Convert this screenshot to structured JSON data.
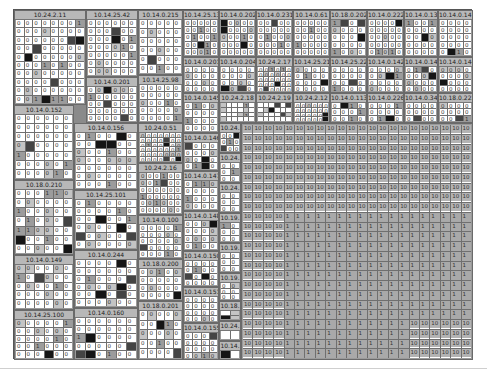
{
  "view": {
    "title": "Host treemap",
    "colors": {
      "background": "#ffffff",
      "frame": "#8a8a8a",
      "header": "#b8b8b8",
      "cell_empty": "#ffffff",
      "cell_light": "#c4c4c4",
      "cell_mid": "#9c9c9c",
      "cell_dark": "#444444",
      "cell_black": "#151515"
    }
  },
  "nodes": [
    {
      "label": "10.24.2.11",
      "x": 0,
      "y": 0,
      "w": 72,
      "h": 95,
      "cols": 8,
      "rows": 10,
      "val": "0"
    },
    {
      "label": "10.14.25.42",
      "x": 72,
      "y": 0,
      "w": 52,
      "h": 67,
      "cols": 6,
      "rows": 7,
      "val": "0"
    },
    {
      "label": "10.14.0.215",
      "x": 124,
      "y": 0,
      "w": 45,
      "h": 65,
      "cols": 5,
      "rows": 6,
      "val": "0"
    },
    {
      "label": "10.14.25.132",
      "x": 169,
      "y": 0,
      "w": 36,
      "h": 47,
      "cols": 5,
      "rows": 5,
      "val": "0"
    },
    {
      "label": "10.14.0.202",
      "x": 205,
      "y": 0,
      "w": 37,
      "h": 47,
      "cols": 5,
      "rows": 5,
      "val": "0"
    },
    {
      "label": "10.14.0.231",
      "x": 242,
      "y": 0,
      "w": 37,
      "h": 47,
      "cols": 5,
      "rows": 5,
      "val": "0"
    },
    {
      "label": "10.14.0.61",
      "x": 279,
      "y": 0,
      "w": 37,
      "h": 47,
      "cols": 5,
      "rows": 5,
      "val": "0"
    },
    {
      "label": "10.18.0.202",
      "x": 316,
      "y": 0,
      "w": 37,
      "h": 47,
      "cols": 4,
      "rows": 5,
      "val": "0"
    },
    {
      "label": "10.14.0.222",
      "x": 353,
      "y": 0,
      "w": 37,
      "h": 47,
      "cols": 5,
      "rows": 5,
      "val": "0"
    },
    {
      "label": "10.14.0.130",
      "x": 390,
      "y": 0,
      "w": 34,
      "h": 47,
      "cols": 4,
      "rows": 5,
      "val": "0"
    },
    {
      "label": "10.14.0.141",
      "x": 424,
      "y": 0,
      "w": 35,
      "h": 47,
      "cols": 4,
      "rows": 5,
      "val": "0"
    },
    {
      "label": "10.14.0.201",
      "x": 72,
      "y": 67,
      "w": 52,
      "h": 46,
      "cols": 6,
      "rows": 5,
      "val": "0"
    },
    {
      "label": "10.14.25.98",
      "x": 124,
      "y": 65,
      "w": 45,
      "h": 48,
      "cols": 5,
      "rows": 5,
      "val": "0"
    },
    {
      "label": "10.14.0.201",
      "x": 169,
      "y": 47,
      "w": 36,
      "h": 36,
      "cols": 4,
      "rows": 4,
      "val": "0"
    },
    {
      "label": "10.14.0.204",
      "x": 205,
      "y": 47,
      "w": 37,
      "h": 36,
      "cols": 4,
      "rows": 4,
      "val": "0"
    },
    {
      "label": "10.24.2.17",
      "x": 242,
      "y": 47,
      "w": 37,
      "h": 36,
      "cols": 6,
      "rows": 5,
      "val": "0"
    },
    {
      "label": "10.14.25.211",
      "x": 279,
      "y": 47,
      "w": 37,
      "h": 36,
      "cols": 4,
      "rows": 4,
      "val": "0"
    },
    {
      "label": "10.14.25.220",
      "x": 316,
      "y": 47,
      "w": 37,
      "h": 36,
      "cols": 4,
      "rows": 4,
      "val": "0"
    },
    {
      "label": "10.14.0.142",
      "x": 353,
      "y": 47,
      "w": 37,
      "h": 36,
      "cols": 4,
      "rows": 4,
      "val": "0"
    },
    {
      "label": "10.14.0.143",
      "x": 390,
      "y": 47,
      "w": 34,
      "h": 36,
      "cols": 4,
      "rows": 4,
      "val": "0"
    },
    {
      "label": "10.14.0.144",
      "x": 424,
      "y": 47,
      "w": 35,
      "h": 36,
      "cols": 4,
      "rows": 4,
      "val": "0"
    },
    {
      "label": "10.14.0.152",
      "x": 0,
      "y": 95,
      "w": 60,
      "h": 75,
      "cols": 6,
      "rows": 7,
      "val": "0"
    },
    {
      "label": "10.14.0.156",
      "x": 60,
      "y": 113,
      "w": 64,
      "h": 67,
      "cols": 6,
      "rows": 7,
      "val": "0"
    },
    {
      "label": "10.24.0.51",
      "x": 124,
      "y": 113,
      "w": 45,
      "h": 40,
      "cols": 7,
      "rows": 6,
      "val": "0"
    },
    {
      "label": "10.14.0.145",
      "x": 169,
      "y": 83,
      "w": 36,
      "h": 40,
      "cols": 4,
      "rows": 4,
      "val": "0"
    },
    {
      "label": "10.24.2.18",
      "x": 205,
      "y": 83,
      "w": 37,
      "h": 30,
      "cols": 6,
      "rows": 4,
      "val": ""
    },
    {
      "label": "10.24.2.19",
      "x": 242,
      "y": 83,
      "w": 37,
      "h": 30,
      "cols": 6,
      "rows": 4,
      "val": ""
    },
    {
      "label": "10.24.2.12",
      "x": 279,
      "y": 83,
      "w": 37,
      "h": 30,
      "cols": 6,
      "rows": 4,
      "val": "0"
    },
    {
      "label": "10.14.0.113",
      "x": 316,
      "y": 83,
      "w": 37,
      "h": 30,
      "cols": 4,
      "rows": 3,
      "val": "0"
    },
    {
      "label": "10.14.0.226",
      "x": 353,
      "y": 83,
      "w": 37,
      "h": 30,
      "cols": 4,
      "rows": 3,
      "val": "0"
    },
    {
      "label": "10.14.0.34",
      "x": 390,
      "y": 83,
      "w": 34,
      "h": 30,
      "cols": 4,
      "rows": 3,
      "val": "0"
    },
    {
      "label": "10.18.0.222",
      "x": 424,
      "y": 83,
      "w": 35,
      "h": 30,
      "cols": 4,
      "rows": 3,
      "val": "0"
    },
    {
      "label": "10.18.0.210",
      "x": 0,
      "y": 170,
      "w": 60,
      "h": 75,
      "cols": 6,
      "rows": 7,
      "val": "0"
    },
    {
      "label": "10.14.25.101",
      "x": 60,
      "y": 180,
      "w": 64,
      "h": 60,
      "cols": 6,
      "rows": 6,
      "val": "0"
    },
    {
      "label": "10.24.2.16",
      "x": 124,
      "y": 153,
      "w": 45,
      "h": 52,
      "cols": 6,
      "rows": 6,
      "val": "0"
    },
    {
      "label": "10.14.0.146",
      "x": 169,
      "y": 123,
      "w": 36,
      "h": 38,
      "cols": 4,
      "rows": 4,
      "val": "0"
    },
    {
      "label": "10.14.0.147",
      "x": 169,
      "y": 161,
      "w": 36,
      "h": 40,
      "cols": 4,
      "rows": 4,
      "val": "0"
    },
    {
      "label": "10.14.0.149",
      "x": 0,
      "y": 245,
      "w": 60,
      "h": 55,
      "cols": 6,
      "rows": 5,
      "val": "0"
    },
    {
      "label": "10.14.0.244",
      "x": 60,
      "y": 240,
      "w": 64,
      "h": 58,
      "cols": 6,
      "rows": 6,
      "val": "0"
    },
    {
      "label": "10.14.0.100",
      "x": 124,
      "y": 205,
      "w": 45,
      "h": 44,
      "cols": 5,
      "rows": 5,
      "val": "0"
    },
    {
      "label": "10.14.0.148",
      "x": 169,
      "y": 201,
      "w": 36,
      "h": 40,
      "cols": 4,
      "rows": 4,
      "val": "0"
    },
    {
      "label": "10.18.0.200",
      "x": 124,
      "y": 249,
      "w": 45,
      "h": 42,
      "cols": 5,
      "rows": 4,
      "val": "0"
    },
    {
      "label": "10.14.0.150",
      "x": 169,
      "y": 241,
      "w": 36,
      "h": 36,
      "cols": 4,
      "rows": 4,
      "val": "0"
    },
    {
      "label": "10.14.25.100",
      "x": 0,
      "y": 300,
      "w": 60,
      "h": 50,
      "cols": 6,
      "rows": 5,
      "val": "0"
    },
    {
      "label": "10.14.0.160",
      "x": 60,
      "y": 298,
      "w": 64,
      "h": 52,
      "cols": 6,
      "rows": 5,
      "val": "0"
    },
    {
      "label": "10.18.0.201",
      "x": 124,
      "y": 291,
      "w": 45,
      "h": 59,
      "cols": 5,
      "rows": 5,
      "val": "0"
    },
    {
      "label": "10.14.0.151",
      "x": 169,
      "y": 277,
      "w": 36,
      "h": 36,
      "cols": 4,
      "rows": 4,
      "val": "0"
    },
    {
      "label": "10.14.0.155",
      "x": 169,
      "y": 313,
      "w": 36,
      "h": 37,
      "cols": 4,
      "rows": 4,
      "val": "0"
    },
    {
      "label": "10.24.",
      "x": 205,
      "y": 113,
      "w": 22,
      "h": 30,
      "cols": 3,
      "rows": 3,
      "val": "0"
    },
    {
      "label": "10.24.",
      "x": 205,
      "y": 143,
      "w": 22,
      "h": 30,
      "cols": 2,
      "rows": 3,
      "val": "0"
    },
    {
      "label": "10.24.",
      "x": 205,
      "y": 173,
      "w": 22,
      "h": 30,
      "cols": 2,
      "rows": 3,
      "val": "0"
    },
    {
      "label": "10.19.",
      "x": 205,
      "y": 203,
      "w": 22,
      "h": 30,
      "cols": 2,
      "rows": 3,
      "val": "0"
    },
    {
      "label": "10.19.",
      "x": 205,
      "y": 233,
      "w": 22,
      "h": 30,
      "cols": 2,
      "rows": 3,
      "val": "0"
    },
    {
      "label": "10.19.",
      "x": 205,
      "y": 263,
      "w": 22,
      "h": 28,
      "cols": 2,
      "rows": 3,
      "val": "0"
    },
    {
      "label": "10.18.",
      "x": 205,
      "y": 291,
      "w": 22,
      "h": 20,
      "cols": 2,
      "rows": 2,
      "val": ""
    },
    {
      "label": "10.24.",
      "x": 205,
      "y": 311,
      "w": 22,
      "h": 20,
      "cols": 2,
      "rows": 1,
      "val": ""
    },
    {
      "label": "10.14.",
      "x": 205,
      "y": 331,
      "w": 22,
      "h": 19,
      "cols": 2,
      "rows": 1,
      "val": ""
    }
  ],
  "big_block": {
    "x": 227,
    "y": 113,
    "w": 232,
    "h": 237,
    "ten_label": "10",
    "one_label": "1",
    "cols": 22,
    "rows": 24,
    "ones_start_col": 4,
    "ones_start_row": 9,
    "tail_ten_col": 16,
    "tail_ten_row": 20
  },
  "shades": [
    "0000000000000000000001000000000000000000000000000001000000000000200000000000000000",
    "00000000000000100000020000000000000000030000",
    "000000043100002000000010000010400000000"
  ]
}
